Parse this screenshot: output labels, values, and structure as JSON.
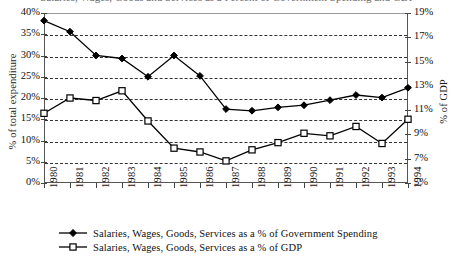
{
  "title_sliver": "Salaries, Wages, Goods and Services as a Percent of Government Spending and GDP",
  "axes": {
    "y_left_title": "% of total expenditure",
    "y_right_title": "% of GDP",
    "y_left_ticks": [
      "40%",
      "35%",
      "30%",
      "25%",
      "20%",
      "15%",
      "10%",
      "5%",
      "0%"
    ],
    "y_right_ticks": [
      "19%",
      "17%",
      "15%",
      "13%",
      "11%",
      "9%",
      "7%",
      "5%"
    ],
    "x_ticks": [
      "1980",
      "1981",
      "1982",
      "1983",
      "1984",
      "1985",
      "1986",
      "1987",
      "1988",
      "1989",
      "1990",
      "1991",
      "1992",
      "1993",
      "1994"
    ]
  },
  "legend": {
    "items": [
      {
        "marker": "filled-diamond-marker",
        "label": "Salaries, Wages, Goods, Services as a % of Government Spending"
      },
      {
        "marker": "open-square-marker",
        "label": "Salaries, Wages, Goods, Services as a % of GDP"
      }
    ]
  },
  "colors": {
    "line": "#000000",
    "marker_fill_diamond": "#000000",
    "marker_fill_square": "#ffffff",
    "grid": "#333333",
    "axis": "#555555",
    "background": "#ffffff"
  },
  "chart_data": {
    "type": "line",
    "title": "Salaries, Wages, Goods and Services as a Percent of Government Spending and GDP",
    "xlabel": "",
    "ylabel": "% of total expenditure",
    "y2label": "% of GDP",
    "x": [
      "1980",
      "1981",
      "1982",
      "1983",
      "1984",
      "1985",
      "1986",
      "1987",
      "1988",
      "1989",
      "1990",
      "1991",
      "1992",
      "1993",
      "1994"
    ],
    "ylim": [
      0,
      40
    ],
    "y2lim": [
      5,
      19
    ],
    "yticks": [
      0,
      5,
      10,
      15,
      20,
      25,
      30,
      35,
      40
    ],
    "y2ticks": [
      5,
      7,
      9,
      11,
      13,
      15,
      17,
      19
    ],
    "grid": true,
    "legend_position": "below",
    "series": [
      {
        "name": "Salaries, Wages, Goods, Services as a % of Government Spending",
        "axis": "left",
        "marker": "filled-diamond",
        "values": [
          38.2,
          35.6,
          30.0,
          29.3,
          25.0,
          30.0,
          25.2,
          17.4,
          17.0,
          17.8,
          18.3,
          19.5,
          20.7,
          20.1,
          22.4
        ]
      },
      {
        "name": "Salaries, Wages, Goods, Services as a % of GDP",
        "axis": "right",
        "marker": "open-square",
        "values": [
          11.2,
          12.8,
          12.6,
          13.2,
          10.7,
          9.0,
          8.6,
          7.2,
          8.7,
          9.4,
          10.2,
          10.0,
          11.1,
          9.3,
          11.9
        ],
        "values_on_left_scale": [
          16.4,
          20.0,
          19.4,
          21.7,
          14.6,
          8.2,
          7.3,
          5.2,
          7.8,
          9.5,
          11.7,
          11.1,
          13.3,
          9.3,
          15.0
        ]
      }
    ]
  }
}
